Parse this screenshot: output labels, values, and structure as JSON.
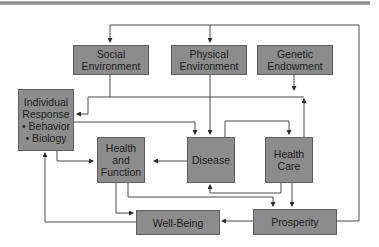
{
  "diagram": {
    "type": "flowchart",
    "nodes": {
      "social_environment": {
        "lines": [
          "Social",
          "Environment"
        ]
      },
      "physical_environment": {
        "lines": [
          "Physical",
          "Environment"
        ]
      },
      "genetic_endowment": {
        "lines": [
          "Genetic",
          "Endowment"
        ]
      },
      "individual_response": {
        "lines": [
          "Individual",
          "Response",
          "• Behavior",
          "• Biology"
        ]
      },
      "health_and_function": {
        "lines": [
          "Health",
          "and",
          "Function"
        ]
      },
      "disease": {
        "lines": [
          "Disease"
        ]
      },
      "health_care": {
        "lines": [
          "Health",
          "Care"
        ]
      },
      "well_being": {
        "lines": [
          "Well-Being"
        ]
      },
      "prosperity": {
        "lines": [
          "Prosperity"
        ]
      }
    },
    "edges": [
      {
        "from": "prosperity",
        "to": "social_environment"
      },
      {
        "from": "prosperity",
        "to": "physical_environment"
      },
      {
        "from": "social_environment",
        "to": "individual_response"
      },
      {
        "from": "social_environment",
        "to": "disease"
      },
      {
        "from": "social_environment",
        "to": "health_care"
      },
      {
        "from": "physical_environment",
        "to": "disease"
      },
      {
        "from": "genetic_endowment",
        "to": "individual_response"
      },
      {
        "from": "health_care",
        "to": "individual_response"
      },
      {
        "from": "individual_response",
        "to": "disease"
      },
      {
        "from": "individual_response",
        "to": "health_and_function"
      },
      {
        "from": "disease",
        "to": "health_and_function"
      },
      {
        "from": "disease",
        "to": "health_care"
      },
      {
        "from": "health_care",
        "to": "disease"
      },
      {
        "from": "health_care",
        "to": "prosperity"
      },
      {
        "from": "health_and_function",
        "to": "well_being"
      },
      {
        "from": "health_and_function",
        "to": "prosperity"
      },
      {
        "from": "prosperity",
        "to": "well_being"
      },
      {
        "from": "well_being",
        "to": "individual_response"
      }
    ],
    "colors": {
      "box_fill": "#8c8c8c",
      "box_border": "#5e5e5e",
      "line": "#3a3a3a",
      "text": "#1c1c1c"
    }
  }
}
